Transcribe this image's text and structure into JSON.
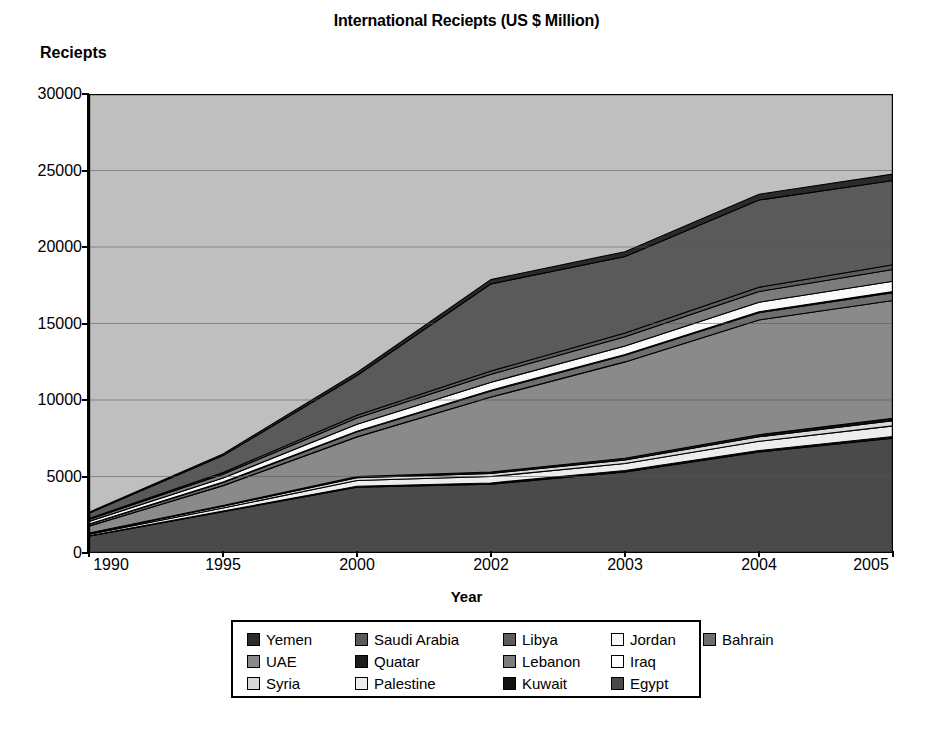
{
  "chart": {
    "title": "International Reciepts (US $ Million)",
    "ylabel": "Reciepts",
    "xlabel": "Year"
  },
  "chart_data": {
    "type": "area",
    "stacked": true,
    "title": "International Reciepts (US $ Million)",
    "xlabel": "Year",
    "ylabel": "Reciepts",
    "grid": true,
    "legend_position": "bottom",
    "categories": [
      "1990",
      "1995",
      "2000",
      "2002",
      "2003",
      "2004",
      "2005"
    ],
    "ylim": [
      0,
      30000
    ],
    "yticks": [
      0,
      5000,
      10000,
      15000,
      20000,
      25000,
      30000
    ],
    "ytick_labels": [
      "0",
      "5000",
      "10000",
      "15000",
      "20000",
      "25000",
      "30000"
    ],
    "series": [
      {
        "name": "Egypt",
        "color": "#4a4a4a",
        "values": [
          1100,
          2700,
          4300,
          4500,
          5300,
          6600,
          7500
        ]
      },
      {
        "name": "Kuwait",
        "color": "#111111",
        "values": [
          30,
          40,
          60,
          80,
          90,
          100,
          110
        ]
      },
      {
        "name": "Palestine",
        "color": "#ededed",
        "values": [
          90,
          200,
          380,
          420,
          460,
          600,
          700
        ]
      },
      {
        "name": "Syria",
        "color": "#d9d9d9",
        "values": [
          60,
          120,
          180,
          200,
          230,
          300,
          340
        ]
      },
      {
        "name": "Quatar",
        "color": "#1c1c1c",
        "values": [
          25,
          45,
          70,
          90,
          110,
          130,
          150
        ]
      },
      {
        "name": "UAE",
        "color": "#8a8a8a",
        "values": [
          450,
          1300,
          2600,
          4900,
          6300,
          7500,
          7700
        ]
      },
      {
        "name": "Bahrain",
        "color": "#6e6e6e",
        "values": [
          120,
          200,
          330,
          400,
          430,
          480,
          520
        ]
      },
      {
        "name": "Iraq",
        "color": "#ffffff",
        "values": [
          20,
          30,
          40,
          50,
          55,
          60,
          65
        ]
      },
      {
        "name": "Jordan",
        "color": "#fafafa",
        "values": [
          170,
          260,
          450,
          520,
          560,
          620,
          680
        ]
      },
      {
        "name": "Lebanon",
        "color": "#7c7c7c",
        "values": [
          130,
          260,
          420,
          520,
          600,
          700,
          760
        ]
      },
      {
        "name": "Libya",
        "color": "#5c5c5c",
        "values": [
          60,
          110,
          170,
          210,
          240,
          280,
          320
        ]
      },
      {
        "name": "Saudi Arabia",
        "color": "#5a5a5a",
        "values": [
          350,
          1100,
          2600,
          5700,
          5000,
          5700,
          5500
        ]
      },
      {
        "name": "Yemen",
        "color": "#2b2b2b",
        "values": [
          60,
          110,
          200,
          280,
          320,
          380,
          420
        ]
      }
    ],
    "totals": [
      2665,
      6475,
      11800,
      17870,
      19695,
      23450,
      24765
    ],
    "annotations": []
  },
  "legend": {
    "rows": [
      [
        {
          "label": "Yemen",
          "swatch": "#2b2b2b"
        },
        {
          "label": "Saudi Arabia",
          "swatch": "#5a5a5a"
        },
        {
          "label": "Libya",
          "swatch": "#5c5c5c"
        },
        {
          "label": "Jordan",
          "swatch": "#fafafa"
        },
        {
          "label": "Bahrain",
          "swatch": "#6e6e6e"
        }
      ],
      [
        {
          "label": "UAE",
          "swatch": "#8a8a8a"
        },
        {
          "label": "Quatar",
          "swatch": "#1c1c1c"
        },
        {
          "label": "Lebanon",
          "swatch": "#7c7c7c"
        },
        {
          "label": "Iraq",
          "swatch": "#ffffff"
        }
      ],
      [
        {
          "label": "Syria",
          "swatch": "#d9d9d9"
        },
        {
          "label": "Palestine",
          "swatch": "#ededed"
        },
        {
          "label": "Kuwait",
          "swatch": "#111111"
        },
        {
          "label": "Egypt",
          "swatch": "#4a4a4a"
        }
      ]
    ]
  },
  "colors": {
    "plot_background": "#bfbfbf",
    "gridline": "#555555",
    "axis": "#000000",
    "page_background": "#ffffff"
  }
}
